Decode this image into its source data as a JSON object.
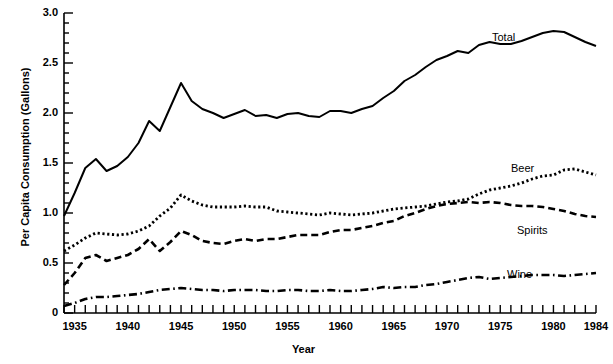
{
  "chart_data": {
    "type": "line",
    "title": "",
    "xlabel": "Year",
    "ylabel": "Per Capita Consumption (Gallons)",
    "xlim": [
      1934,
      1984
    ],
    "ylim": [
      0,
      3.0
    ],
    "grid": false,
    "legend_position": "inline-annotations",
    "x_tick_labels": [
      "1935",
      "1940",
      "1945",
      "1950",
      "1955",
      "1960",
      "1965",
      "1970",
      "1975",
      "1980",
      "1984"
    ],
    "x_tick_values": [
      1935,
      1940,
      1945,
      1950,
      1955,
      1960,
      1965,
      1970,
      1975,
      1980,
      1984
    ],
    "y_tick_labels": [
      "0",
      "0.5",
      "1.0",
      "1.5",
      "2.0",
      "2.5",
      "3.0"
    ],
    "y_tick_values": [
      0,
      0.5,
      1.0,
      1.5,
      2.0,
      2.5,
      3.0
    ],
    "y_minor_tick_step": 0.1,
    "x": [
      1934,
      1935,
      1936,
      1937,
      1938,
      1939,
      1940,
      1941,
      1942,
      1943,
      1944,
      1945,
      1946,
      1947,
      1948,
      1949,
      1950,
      1951,
      1952,
      1953,
      1954,
      1955,
      1956,
      1957,
      1958,
      1959,
      1960,
      1961,
      1962,
      1963,
      1964,
      1965,
      1966,
      1967,
      1968,
      1969,
      1970,
      1971,
      1972,
      1973,
      1974,
      1975,
      1976,
      1977,
      1978,
      1979,
      1980,
      1981,
      1982,
      1983,
      1984
    ],
    "series": [
      {
        "name": "Total",
        "style": "solid",
        "color": "#000000",
        "values": [
          0.97,
          1.2,
          1.45,
          1.54,
          1.42,
          1.47,
          1.56,
          1.7,
          1.92,
          1.82,
          2.06,
          2.3,
          2.12,
          2.04,
          2.0,
          1.95,
          1.99,
          2.03,
          1.97,
          1.98,
          1.95,
          1.99,
          2.0,
          1.97,
          1.96,
          2.02,
          2.02,
          2.0,
          2.04,
          2.07,
          2.15,
          2.22,
          2.32,
          2.38,
          2.46,
          2.53,
          2.57,
          2.62,
          2.6,
          2.68,
          2.71,
          2.69,
          2.69,
          2.72,
          2.76,
          2.8,
          2.82,
          2.81,
          2.76,
          2.71,
          2.67
        ]
      },
      {
        "name": "Beer",
        "style": "dotted",
        "color": "#000000",
        "values": [
          0.62,
          0.68,
          0.75,
          0.8,
          0.79,
          0.78,
          0.79,
          0.82,
          0.87,
          0.97,
          1.05,
          1.18,
          1.12,
          1.08,
          1.06,
          1.06,
          1.06,
          1.07,
          1.06,
          1.06,
          1.02,
          1.01,
          1.0,
          0.99,
          0.98,
          1.0,
          0.99,
          0.98,
          0.99,
          1.0,
          1.02,
          1.04,
          1.05,
          1.06,
          1.07,
          1.09,
          1.11,
          1.12,
          1.14,
          1.19,
          1.23,
          1.25,
          1.27,
          1.3,
          1.34,
          1.37,
          1.38,
          1.43,
          1.44,
          1.41,
          1.38
        ]
      },
      {
        "name": "Spirits",
        "style": "dashed",
        "color": "#000000",
        "values": [
          0.28,
          0.4,
          0.55,
          0.58,
          0.52,
          0.55,
          0.58,
          0.64,
          0.74,
          0.62,
          0.71,
          0.82,
          0.78,
          0.72,
          0.7,
          0.69,
          0.72,
          0.74,
          0.72,
          0.74,
          0.74,
          0.76,
          0.78,
          0.78,
          0.78,
          0.81,
          0.83,
          0.83,
          0.85,
          0.87,
          0.9,
          0.92,
          0.97,
          1.0,
          1.04,
          1.07,
          1.09,
          1.1,
          1.11,
          1.1,
          1.11,
          1.1,
          1.08,
          1.07,
          1.07,
          1.06,
          1.04,
          1.02,
          0.99,
          0.97,
          0.96
        ]
      },
      {
        "name": "Wine",
        "style": "dash-dot",
        "color": "#000000",
        "values": [
          0.07,
          0.1,
          0.14,
          0.16,
          0.16,
          0.17,
          0.18,
          0.19,
          0.21,
          0.23,
          0.24,
          0.25,
          0.24,
          0.23,
          0.23,
          0.22,
          0.23,
          0.23,
          0.23,
          0.22,
          0.22,
          0.23,
          0.23,
          0.22,
          0.22,
          0.23,
          0.22,
          0.22,
          0.23,
          0.24,
          0.26,
          0.25,
          0.26,
          0.26,
          0.28,
          0.29,
          0.31,
          0.33,
          0.35,
          0.36,
          0.34,
          0.35,
          0.36,
          0.37,
          0.38,
          0.38,
          0.38,
          0.37,
          0.38,
          0.39,
          0.4
        ]
      }
    ],
    "annotations": [
      {
        "text": "Total",
        "x_px": 492,
        "y_px": 31
      },
      {
        "text": "Beer",
        "x_px": 511,
        "y_px": 162
      },
      {
        "text": "Spirits",
        "x_px": 517,
        "y_px": 224
      },
      {
        "text": "Wine",
        "x_px": 507,
        "y_px": 268
      }
    ]
  }
}
